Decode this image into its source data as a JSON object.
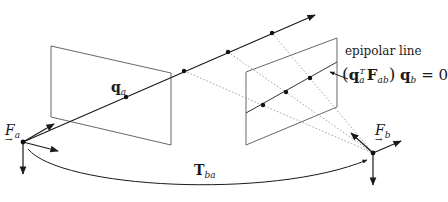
{
  "diagram": {
    "labels": {
      "frame_a": "F",
      "frame_a_sub": "a",
      "frame_b": "F",
      "frame_b_sub": "b",
      "point_a": "q",
      "point_a_sub": "a",
      "transform": "T",
      "transform_sub": "ba",
      "epipolar_line_caption": "epipolar line",
      "eq_open": "(",
      "eq_q": "q",
      "eq_q_sub": "a",
      "eq_q_sup": "T",
      "eq_F": "F",
      "eq_F_sub": "ab",
      "eq_close": ")",
      "eq_qb": "q",
      "eq_qb_sub": "b",
      "eq_rhs": "= 0",
      "vector_arrow": "→"
    },
    "nodes": [
      {
        "id": "frame_a_origin",
        "x": 23,
        "y": 142
      },
      {
        "id": "q_a",
        "x": 126,
        "y": 97
      },
      {
        "id": "ray_point_1",
        "x": 184,
        "y": 71
      },
      {
        "id": "ray_point_2",
        "x": 228,
        "y": 52
      },
      {
        "id": "ray_point_3",
        "x": 272,
        "y": 33
      },
      {
        "id": "epi_point_1",
        "x": 263,
        "y": 105
      },
      {
        "id": "epi_point_2",
        "x": 286,
        "y": 92
      },
      {
        "id": "epi_point_3",
        "x": 310,
        "y": 78
      },
      {
        "id": "frame_b_origin",
        "x": 373,
        "y": 153
      }
    ],
    "edges": [
      {
        "from": "frame_a_origin",
        "to": "ray_end",
        "style": "solid-arrow"
      },
      {
        "from": "ray_point_1",
        "to": "frame_b_origin",
        "style": "dotted"
      },
      {
        "from": "ray_point_2",
        "to": "frame_b_origin",
        "style": "dotted"
      },
      {
        "from": "ray_point_3",
        "to": "frame_b_origin",
        "style": "dotted"
      },
      {
        "from": "frame_a_origin",
        "to": "frame_b_origin",
        "style": "curved-arrow",
        "label": "T_ba"
      }
    ],
    "colors": {
      "line": "#2a2a2a",
      "dotted": "#8a8a8a",
      "plane": "#555555",
      "background": "#ffffff"
    }
  }
}
